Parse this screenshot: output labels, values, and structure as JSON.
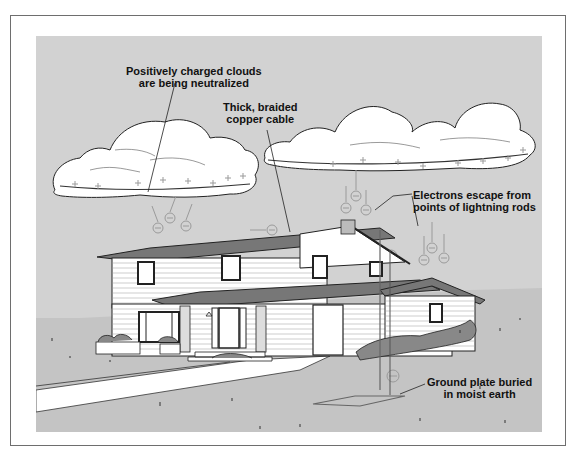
{
  "figure": {
    "colors": {
      "panel_background": "#d2d2d2",
      "ground": "#c4c4c4",
      "cloud": "#ffffff",
      "line": "#222222",
      "charge_symbols": "#9a9a9a",
      "frame_border": "#6e6e6e"
    }
  },
  "labels": {
    "clouds": {
      "line1": "Positively charged clouds",
      "line2": "are being neutralized"
    },
    "cable": {
      "line1": "Thick, braided",
      "line2": "copper cable"
    },
    "electrons": {
      "line1": "Electrons escape from",
      "line2": "points of lightning rods"
    },
    "ground_plate": {
      "line1": "Ground plate buried",
      "line2": "in moist earth"
    }
  },
  "symbols": {
    "positive_charge": "+",
    "electron": "⊖"
  }
}
